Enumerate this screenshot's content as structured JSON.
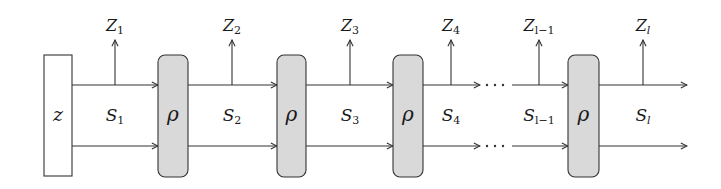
{
  "diagram": {
    "title": "",
    "source_node": {
      "label": "z"
    },
    "operators": [
      {
        "label": "ρ"
      },
      {
        "label": "ρ"
      },
      {
        "label": "ρ"
      },
      {
        "label": "ρ"
      }
    ],
    "states": [
      {
        "base": "S",
        "sub": "1"
      },
      {
        "base": "S",
        "sub": "2"
      },
      {
        "base": "S",
        "sub": "3"
      },
      {
        "base": "S",
        "sub": "4"
      },
      {
        "base": "S",
        "sub": "l−1"
      },
      {
        "base": "S",
        "sub": "l"
      }
    ],
    "outputs": [
      {
        "base": "Z",
        "sub": "1"
      },
      {
        "base": "Z",
        "sub": "2"
      },
      {
        "base": "Z",
        "sub": "3"
      },
      {
        "base": "Z",
        "sub": "4"
      },
      {
        "base": "Z",
        "sub": "l−1"
      },
      {
        "base": "Z",
        "sub": "l"
      }
    ],
    "ellipsis": "⋯",
    "colors": {
      "stroke": "#333333",
      "operator_fill": "#d9d9d9",
      "source_fill": "#ffffff"
    }
  }
}
